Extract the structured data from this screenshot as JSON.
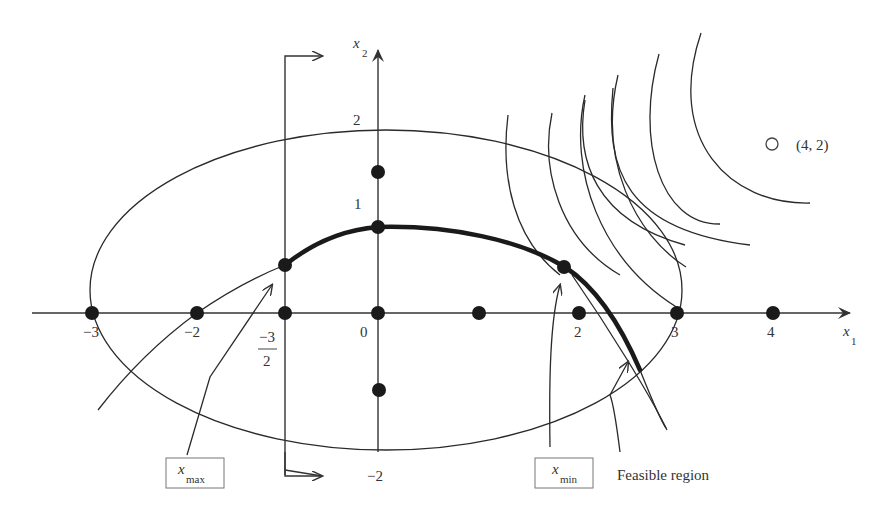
{
  "figure": {
    "axes": {
      "x_label": "x",
      "x_label_sub": "1",
      "y_label": "x",
      "y_label_sub": "2",
      "x_ticks": [
        {
          "value": -3,
          "label": "−3"
        },
        {
          "value": -2,
          "label": "−2"
        },
        {
          "value": -1.5,
          "label_num": "−3",
          "label_den": "2"
        },
        {
          "value": 0,
          "label": "0"
        },
        {
          "value": 2,
          "label": "2"
        },
        {
          "value": 3,
          "label": "3"
        },
        {
          "value": 4,
          "label": "4"
        }
      ],
      "y_ticks": [
        {
          "value": 2,
          "label": "2"
        },
        {
          "value": 1,
          "label": "1"
        },
        {
          "value": -2,
          "label": "−2"
        }
      ]
    },
    "tick_labels": {
      "xm3": "−3",
      "xm2": "−2",
      "xm15_num": "−3",
      "xm15_den": "2",
      "x0": "0",
      "x2": "2",
      "x3": "3",
      "x4": "4",
      "y2": "2",
      "y1": "1",
      "ym2": "−2"
    },
    "target_point": {
      "marker": "O",
      "label": "(4, 2)"
    },
    "annotations": {
      "x_max_main": "x",
      "x_max_sub": "max",
      "x_min_main": "x",
      "x_min_sub": "min",
      "feasible_region": "Feasible region"
    },
    "lattice_points": [
      [
        -3,
        0
      ],
      [
        -2,
        0
      ],
      [
        -1.5,
        0
      ],
      [
        0,
        0
      ],
      [
        1,
        0
      ],
      [
        2,
        0
      ],
      [
        3,
        0
      ],
      [
        4,
        0
      ],
      [
        0,
        2
      ],
      [
        0,
        1
      ],
      [
        0,
        -1
      ],
      [
        -1.5,
        0.5
      ],
      [
        1.9,
        0.5
      ]
    ],
    "colors": {
      "ink": "#1a1a1a",
      "text": "#333333",
      "box_border": "#777777",
      "background": "#ffffff"
    }
  }
}
